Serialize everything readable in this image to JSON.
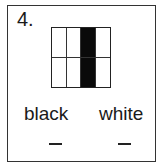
{
  "question": {
    "number": "4.",
    "grid": {
      "rows": 2,
      "cols": 4,
      "shaded_column": 3,
      "cells": [
        [
          "white",
          "white",
          "black",
          "white"
        ],
        [
          "white",
          "white",
          "black",
          "white"
        ]
      ],
      "colors": {
        "black": "#0a0a0a",
        "white": "#ffffff"
      }
    },
    "labels": [
      {
        "text": "black",
        "answer": "_"
      },
      {
        "text": "white",
        "answer": "_"
      }
    ]
  }
}
